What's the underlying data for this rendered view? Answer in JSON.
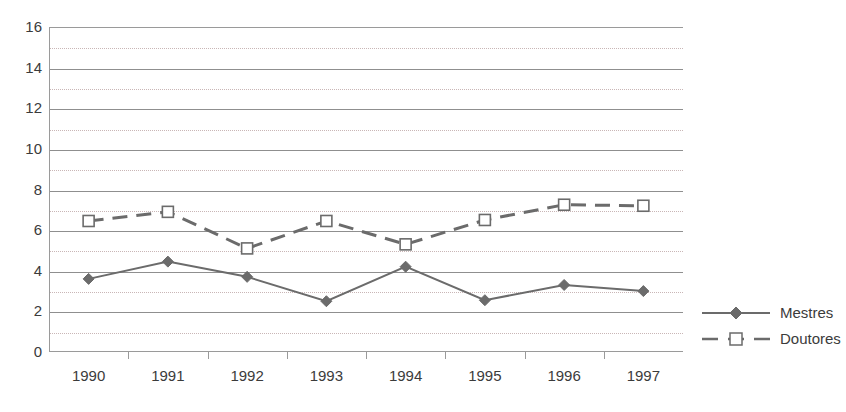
{
  "chart_data": {
    "type": "line",
    "title": "",
    "xlabel": "",
    "ylabel": "",
    "categories": [
      "1990",
      "1991",
      "1992",
      "1993",
      "1994",
      "1995",
      "1996",
      "1997"
    ],
    "series": [
      {
        "name": "Mestres",
        "values": [
          3.6,
          4.45,
          3.7,
          2.5,
          4.2,
          2.55,
          3.3,
          3.0
        ],
        "color": "#6b6b6b",
        "line_style": "solid",
        "marker": "filled-diamond"
      },
      {
        "name": "Doutores",
        "values": [
          6.45,
          6.9,
          5.1,
          6.45,
          5.3,
          6.5,
          7.25,
          7.2
        ],
        "color": "#6b6b6b",
        "line_style": "dashed",
        "marker": "open-square"
      }
    ],
    "ylim": [
      0,
      16
    ],
    "y_major_ticks": [
      0,
      2,
      4,
      6,
      8,
      10,
      12,
      14,
      16
    ],
    "y_minor_ticks": [
      1,
      3,
      5,
      7,
      9,
      11,
      13,
      15
    ],
    "y_tick_labels": [
      "16",
      "14",
      "12",
      "10",
      "8",
      "6",
      "4",
      "2",
      "0"
    ],
    "grid": "horizontal",
    "legend_position": "right"
  },
  "legend": {
    "entries": [
      {
        "label": "Mestres"
      },
      {
        "label": "Doutores"
      }
    ]
  },
  "colors": {
    "series": "#6b6b6b",
    "axis": "#9a9a9a",
    "major_grid": "#8f8f8f",
    "minor_grid": "#c9b6b6",
    "text": "#3b3b3b",
    "background": "#ffffff"
  }
}
